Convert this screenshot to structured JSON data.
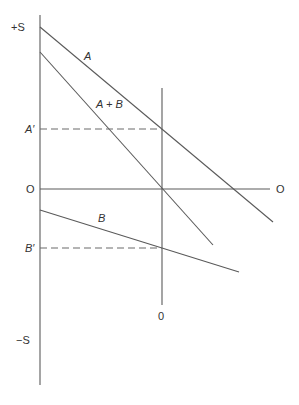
{
  "diagram": {
    "axis_labels": {
      "top": "+S",
      "bottom": "−S",
      "left_origin": "O",
      "right_origin": "O",
      "vertical_origin": "0"
    },
    "curves": [
      {
        "id": "A",
        "label": "A"
      },
      {
        "id": "A_plus_B",
        "label": "A + B"
      },
      {
        "id": "B",
        "label": "B"
      }
    ],
    "reference_levels": [
      {
        "id": "A_prime",
        "label": "A′"
      },
      {
        "id": "B_prime",
        "label": "B′"
      }
    ],
    "colors": {
      "line": "#5a5a5a",
      "text": "#333333",
      "background": "#ffffff"
    }
  }
}
